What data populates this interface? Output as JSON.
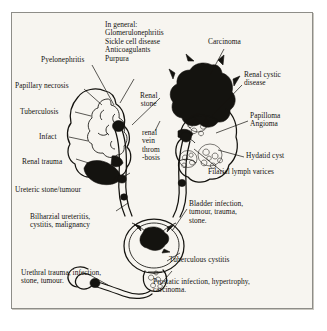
{
  "figure": {
    "colors": {
      "ink": "#14130f",
      "paper": "#f7f5f0",
      "frame": "#8e8d88"
    },
    "labels": {
      "general": "In general:\nGlomerulonephritis\nSickle cell disease\nAnticoagulants\nPurpura",
      "pyelonephritis": "Pyelonephritis",
      "papillary_necrosis": "Papillary necrosis",
      "tuberculosis": "Tuberculosis",
      "infarct": "Infact",
      "renal_trauma": "Renal trauma",
      "ureteric_stone": "Ureteric stone/tumour",
      "bilharzial": "Bilharzial ureteritis,\ncystitis, malignancy",
      "urethral": "Urethral trauma, infection,\nstone, tumour.",
      "renal_stone": "Renal\nstone",
      "renal_vein_thrombosis": "renal\nvein\nthrom\n-bosis",
      "carcinoma": "Carcinoma",
      "renal_cystic_disease": "Renal cystic\ndisease",
      "papilloma_angioma": "Papilloma\nAngioma",
      "hydatid_cyst": "Hydatid cyst",
      "filarial": "Filarial lymph varices",
      "bladder": "Bladder infection,\ntumour, trauma,\nstone.",
      "tuberculous_cystitis": "Tuberculous cystitis",
      "prostatic": "Prostatic infection, hypertrophy,\ncarcinoma."
    },
    "organ_names": {
      "left_kidney": "left-kidney",
      "right_kidney": "right-kidney",
      "left_ureter": "left-ureter",
      "right_ureter": "right-ureter",
      "bladder": "urinary-bladder",
      "prostate": "prostate-gland",
      "urethra": "urethra",
      "renal_mass": "renal-carcinoma-mass",
      "cysts": "renal-cysts"
    }
  }
}
